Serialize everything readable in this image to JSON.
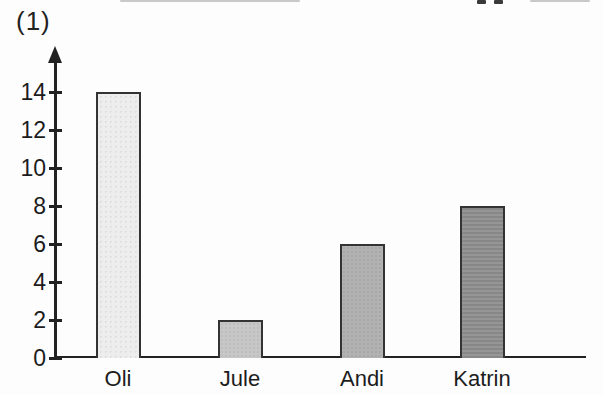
{
  "page": {
    "label": "(1)"
  },
  "chart_data": {
    "type": "bar",
    "title": "",
    "xlabel": "",
    "ylabel": "",
    "categories": [
      "Oli",
      "Jule",
      "Andi",
      "Katrin"
    ],
    "values": [
      14,
      2,
      6,
      8
    ],
    "bar_colors": [
      "#ededed",
      "#c7c7c7",
      "#b2b2b2",
      "#8d8d8d"
    ],
    "bar_border_color": "#333333",
    "axis_color": "#222222",
    "ylim": [
      0,
      15
    ],
    "yticks": [
      0,
      2,
      4,
      6,
      8,
      10,
      12,
      14
    ],
    "grid": false,
    "legend_position": "none"
  }
}
